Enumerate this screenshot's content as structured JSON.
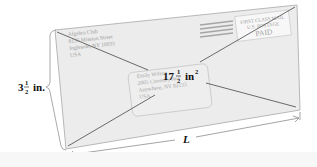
{
  "envelope": {
    "return_address": [
      "Algebra Club",
      "8135 Mission Street",
      "Ingleside, NY 10033",
      "USA"
    ],
    "recipient_address": [
      "Emily Wilson",
      "2005 Coventry Ave",
      "Anywhere, NY 82133",
      "USA"
    ],
    "postage": {
      "line1": "FIRST CLASS MAIL",
      "line2": "U.S. POSTAGE",
      "line3": "PAID"
    },
    "colors": {
      "fill": "#ececec",
      "outline": "#b5b5b5",
      "diagonal": "#555555",
      "text": "#9a9a9a",
      "stripes": "#a0a0a0"
    }
  },
  "labels": {
    "area_whole": "17",
    "area_num": "1",
    "area_den": "2",
    "area_unit": "in",
    "area_exp": "2",
    "height_whole": "3",
    "height_num": "1",
    "height_den": "2",
    "height_unit": "in.",
    "length": "L"
  }
}
